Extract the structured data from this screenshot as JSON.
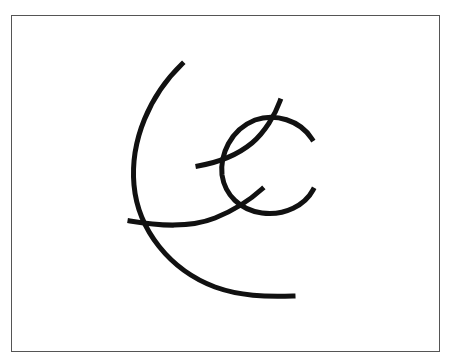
{
  "drawing": {
    "description": "Hand-drawn line sketch of intersecting arcs inside a rectangular frame",
    "stroke_color": "#111111",
    "frame_color": "#555555",
    "background_color": "#ffffff",
    "strokes": [
      {
        "name": "large-arc"
      },
      {
        "name": "small-c-arc"
      },
      {
        "name": "lower-diagonal-curve"
      },
      {
        "name": "upper-diagonal-curve"
      }
    ]
  }
}
